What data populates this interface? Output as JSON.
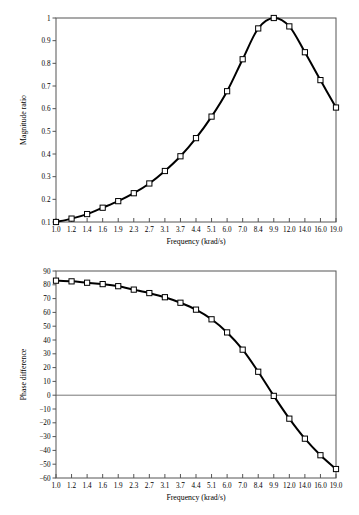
{
  "chart_data": [
    {
      "type": "line",
      "id": "magnitude",
      "title": "",
      "xlabel": "Frequency (krad/s)",
      "ylabel": "Magnitude ratio",
      "categories": [
        "1.0",
        "1.2",
        "1.4",
        "1.6",
        "1.9",
        "2.3",
        "2.7",
        "3.1",
        "3.7",
        "4.4",
        "5.1",
        "6.0",
        "7.0",
        "8.4",
        "9.9",
        "12.0",
        "14.0",
        "16.0",
        "19.0"
      ],
      "x": [
        1.0,
        1.2,
        1.4,
        1.6,
        1.9,
        2.3,
        2.7,
        3.1,
        3.7,
        4.4,
        5.1,
        6.0,
        7.0,
        8.4,
        9.9,
        12.0,
        14.0,
        16.0,
        19.0
      ],
      "values": [
        0.1,
        0.115,
        0.135,
        0.163,
        0.192,
        0.227,
        0.27,
        0.325,
        0.39,
        0.47,
        0.565,
        0.677,
        0.818,
        0.954,
        1.0,
        0.963,
        0.849,
        0.726,
        0.605
      ],
      "ylim": [
        0.1,
        1.0
      ],
      "yticks": [
        "0.1",
        "0.2",
        "0.3",
        "0.4",
        "0.5",
        "0.6",
        "0.7",
        "0.8",
        "0.9",
        "1"
      ],
      "ytickvals": [
        0.1,
        0.2,
        0.3,
        0.4,
        0.5,
        0.6,
        0.7,
        0.8,
        0.9,
        1.0
      ],
      "marker": "open-square",
      "grid": false,
      "legend": "none",
      "xscale": "categorical-log"
    },
    {
      "type": "line",
      "id": "phase",
      "title": "",
      "xlabel": "Frequency (krad/s)",
      "ylabel": "Phase difference",
      "categories": [
        "1.0",
        "1.2",
        "1.4",
        "1.6",
        "1.9",
        "2.3",
        "2.7",
        "3.1",
        "3.7",
        "4.4",
        "5.1",
        "6.0",
        "7.0",
        "8.4",
        "9.9",
        "12.0",
        "14.0",
        "16.0",
        "19.0"
      ],
      "x": [
        1.0,
        1.2,
        1.4,
        1.6,
        1.9,
        2.3,
        2.7,
        3.1,
        3.7,
        4.4,
        5.1,
        6.0,
        7.0,
        8.4,
        9.9,
        12.0,
        14.0,
        16.0,
        19.0
      ],
      "values": [
        83,
        82.5,
        81.5,
        80.5,
        79,
        76.5,
        74,
        71,
        67,
        62,
        55,
        45.5,
        33,
        17,
        -0.5,
        -17,
        -31.5,
        -43.5,
        -53.5
      ],
      "ylim": [
        -60,
        90
      ],
      "yticks": [
        "90",
        "80",
        "70",
        "60",
        "50",
        "40",
        "30",
        "20",
        "10",
        "0",
        "−10",
        "−20",
        "−30",
        "−40",
        "−50",
        "−60"
      ],
      "ytickvals": [
        90,
        80,
        70,
        60,
        50,
        40,
        30,
        20,
        10,
        0,
        -10,
        -20,
        -30,
        -40,
        -50,
        -60
      ],
      "marker": "open-square",
      "grid": false,
      "legend": "none",
      "zero_line": true,
      "xscale": "categorical-log"
    }
  ],
  "colors": {
    "curve": "#000000",
    "marker_fill": "#ffffff",
    "frame": "#555555",
    "zero_line": "#777777",
    "background": "#ffffff"
  }
}
